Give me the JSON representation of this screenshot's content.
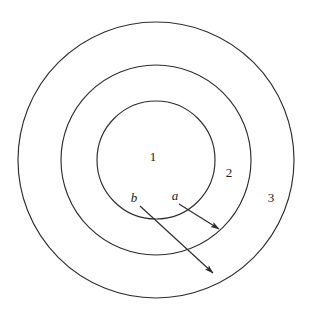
{
  "figure": {
    "background_color": "#ffffff",
    "stroke_color": "#2e2e2e",
    "text_color": "#1b1b1b",
    "center": {
      "x": 156,
      "y": 160
    },
    "circles": [
      {
        "name": "inner-circle",
        "radius": 59
      },
      {
        "name": "middle-circle",
        "radius": 95
      },
      {
        "name": "outer-circle",
        "radius": 138
      }
    ],
    "region_labels": [
      {
        "text": "1",
        "x": 153,
        "y": 158
      },
      {
        "text": "2",
        "x": 229,
        "y": 174
      },
      {
        "text": "3",
        "x": 271,
        "y": 199
      }
    ],
    "arrow_labels": [
      {
        "text": "b",
        "x": 134,
        "y": 199
      },
      {
        "text": "a",
        "x": 175,
        "y": 197
      }
    ],
    "arrows": [
      {
        "name": "arrow-a",
        "label": "a",
        "start": {
          "x": 179,
          "y": 204
        },
        "end": {
          "x": 219,
          "y": 229
        }
      },
      {
        "name": "arrow-b",
        "label": "b",
        "start": {
          "x": 140,
          "y": 206
        },
        "end": {
          "x": 213,
          "y": 273
        }
      }
    ]
  }
}
